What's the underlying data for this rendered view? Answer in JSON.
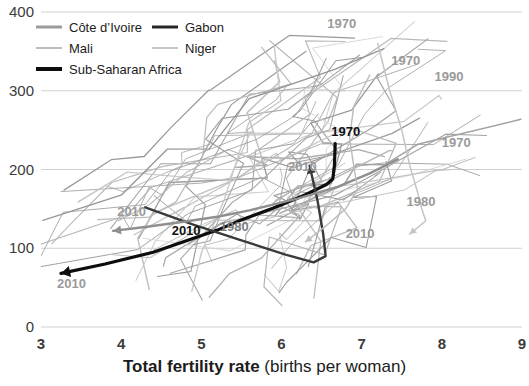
{
  "chart_data": {
    "type": "line",
    "title": "",
    "xlabel_bold": "Total fertility rate",
    "xlabel_rest": "(births per woman)",
    "ylabel": "",
    "xlim": [
      3,
      9
    ],
    "ylim": [
      0,
      400
    ],
    "xticks": [
      "3",
      "4",
      "5",
      "6",
      "7",
      "8",
      "9"
    ],
    "yticks": [
      "0",
      "100",
      "200",
      "300",
      "400"
    ],
    "grid": "horizontal",
    "legend_position": "top-left",
    "colors": {
      "cote_divoire": "#9b9b9b",
      "gabon": "#262626",
      "mali": "#bdbdbd",
      "niger": "#c8c8c8",
      "sub_saharan_africa": "#0d0d0d",
      "background_lines": "#b9b9b9",
      "gridline": "#d0d0d0",
      "text": "#1c1c1c"
    },
    "legend": [
      {
        "name": "cote-divoire",
        "label": "Côte d’Ivoire",
        "color": "#9b9b9b",
        "weight": "medium"
      },
      {
        "name": "gabon",
        "label": "Gabon",
        "color": "#262626",
        "weight": "medium"
      },
      {
        "name": "mali",
        "label": "Mali",
        "color": "#bdbdbd",
        "weight": "thin"
      },
      {
        "name": "niger",
        "label": "Niger",
        "color": "#c8c8c8",
        "weight": "thin"
      },
      {
        "name": "sub-saharan-africa",
        "label": "Sub-Saharan Africa",
        "color": "#0d0d0d",
        "weight": "bold"
      }
    ],
    "annotations": [
      {
        "name": "ann-ssa-1970",
        "text": "1970",
        "x": 6.62,
        "y": 243,
        "style": "dark"
      },
      {
        "name": "ann-ssa-2010",
        "text": "2010",
        "x": 4.63,
        "y": 117,
        "style": "dark"
      },
      {
        "name": "ann-cotedivoire-1980",
        "text": "1980",
        "x": 5.23,
        "y": 122,
        "style": "midgray"
      },
      {
        "name": "ann-cotedivoire-2010",
        "text": "2010",
        "x": 3.95,
        "y": 141,
        "style": "gray"
      },
      {
        "name": "ann-mali-2010",
        "text": "2010",
        "x": 3.2,
        "y": 49,
        "style": "gray"
      },
      {
        "name": "ann-niger-2010",
        "text": "2010",
        "x": 6.08,
        "y": 198,
        "style": "gray"
      },
      {
        "name": "ann-niger-1970",
        "text": "1970",
        "x": 6.57,
        "y": 380,
        "style": "gray"
      },
      {
        "name": "ann-gabon-1970",
        "text": "1970",
        "x": 7.37,
        "y": 333,
        "style": "gray"
      },
      {
        "name": "ann-gabon-1990",
        "text": "1990",
        "x": 7.91,
        "y": 313,
        "style": "gray"
      },
      {
        "name": "ann-other-1970",
        "text": "1970",
        "x": 8.0,
        "y": 228,
        "style": "gray"
      },
      {
        "name": "ann-other-1980",
        "text": "1980",
        "x": 7.56,
        "y": 154,
        "style": "gray"
      },
      {
        "name": "ann-other-2010",
        "text": "2010",
        "x": 6.8,
        "y": 113,
        "style": "gray"
      }
    ],
    "series": [
      {
        "name": "sub-saharan-africa",
        "label": "Sub-Saharan Africa",
        "color": "#0d0d0d",
        "width": 3.2,
        "points": [
          [
            6.67,
            233
          ],
          [
            6.66,
            205
          ],
          [
            6.64,
            188
          ],
          [
            6.56,
            181
          ],
          [
            6.3,
            168
          ],
          [
            5.9,
            151
          ],
          [
            5.5,
            136
          ],
          [
            5.2,
            123
          ],
          [
            4.4,
            95
          ],
          [
            3.8,
            80
          ],
          [
            3.25,
            68
          ]
        ]
      },
      {
        "name": "gabon",
        "label": "Gabon",
        "color": "#3a3a3a",
        "width": 2.4,
        "points": [
          [
            4.3,
            152
          ],
          [
            4.9,
            130
          ],
          [
            5.5,
            110
          ],
          [
            6.05,
            92
          ],
          [
            6.4,
            82
          ],
          [
            6.55,
            90
          ],
          [
            6.52,
            118
          ],
          [
            6.45,
            160
          ],
          [
            6.35,
            205
          ]
        ]
      },
      {
        "name": "cote-divoire",
        "label": "Côte d’Ivoire",
        "color": "#8f8f8f",
        "width": 2.4,
        "points": [
          [
            7.45,
            213
          ],
          [
            7.1,
            195
          ],
          [
            6.7,
            178
          ],
          [
            6.2,
            163
          ],
          [
            5.6,
            148
          ],
          [
            5.2,
            140
          ],
          [
            4.8,
            134
          ],
          [
            4.3,
            127
          ],
          [
            3.9,
            122
          ]
        ]
      },
      {
        "name": "mali",
        "label": "Mali",
        "color": "#bdbdbd",
        "width": 1.5,
        "points": [
          [
            7.1,
            320
          ],
          [
            6.9,
            280
          ],
          [
            6.85,
            240
          ],
          [
            6.9,
            205
          ],
          [
            6.95,
            175
          ],
          [
            6.8,
            150
          ],
          [
            6.55,
            128
          ],
          [
            6.3,
            108
          ]
        ]
      },
      {
        "name": "niger",
        "label": "Niger",
        "color": "#c4c4c4",
        "width": 1.5,
        "points": [
          [
            7.2,
            360
          ],
          [
            7.35,
            300
          ],
          [
            7.5,
            250
          ],
          [
            7.6,
            205
          ],
          [
            7.7,
            170
          ],
          [
            7.75,
            150
          ],
          [
            7.8,
            135
          ],
          [
            7.6,
            118
          ]
        ]
      }
    ],
    "background_series_count": 44
  }
}
